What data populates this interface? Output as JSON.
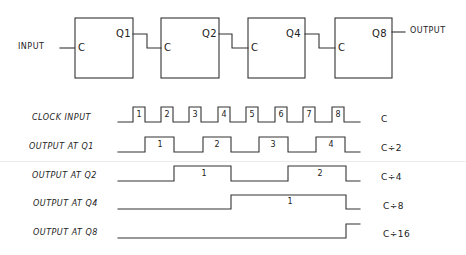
{
  "block_diagram": {
    "input_label": "INPUT",
    "output_label": "OUTPUT",
    "stages": [
      {
        "clock_label": "C",
        "output_label": "Q1"
      },
      {
        "clock_label": "C",
        "output_label": "Q2"
      },
      {
        "clock_label": "C",
        "output_label": "Q4"
      },
      {
        "clock_label": "C",
        "output_label": "Q8"
      }
    ]
  },
  "timing": {
    "rows": [
      {
        "label": "CLOCK INPUT",
        "ratio": "C",
        "pulse_numbers": [
          "1",
          "2",
          "3",
          "4",
          "5",
          "6",
          "7",
          "8"
        ]
      },
      {
        "label": "OUTPUT AT Q1",
        "ratio": "C÷2",
        "pulse_numbers": [
          "1",
          "2",
          "3",
          "4"
        ]
      },
      {
        "label": "OUTPUT AT Q2",
        "ratio": "C÷4",
        "pulse_numbers": [
          "1",
          "2"
        ]
      },
      {
        "label": "OUTPUT AT Q4",
        "ratio": "C÷8",
        "pulse_numbers": [
          "1"
        ]
      },
      {
        "label": "OUTPUT AT Q8",
        "ratio": "C÷16",
        "pulse_numbers": []
      }
    ]
  },
  "colors": {
    "ink": "#333333",
    "background": "#ffffff"
  }
}
